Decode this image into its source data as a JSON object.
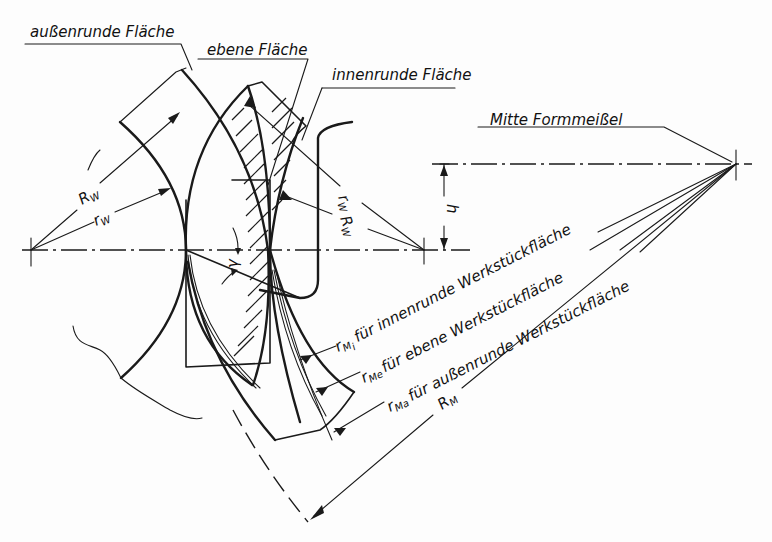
{
  "diagram": {
    "type": "technical-drawing",
    "labels": {
      "outer_round_surface": "außenrunde Fläche",
      "flat_surface": "ebene Fläche",
      "inner_round_surface": "innenrunde Fläche",
      "tool_center": "Mitte Formmeißel"
    },
    "dimensions": {
      "R_W_left": "R",
      "R_W_left_sub": "W",
      "r_W_left": "r",
      "r_W_left_sub": "W",
      "r_W_right": "r",
      "r_W_right_sub": "W",
      "R_W_right": "R",
      "R_W_right_sub": "W",
      "h": "h",
      "gamma": "γ",
      "gamma_sub": "o",
      "R_M": "R",
      "R_M_sub": "M"
    },
    "radius_callouts": [
      {
        "symbol": "r",
        "sub": "M",
        "subsub": "i",
        "text": "für innenrunde Werkstückfläche"
      },
      {
        "symbol": "r",
        "sub": "M",
        "subsub": "e",
        "text": "für ebene Werkstückfläche"
      },
      {
        "symbol": "r",
        "sub": "M",
        "subsub": "a",
        "text": "für außenrunde Werkstückfläche"
      }
    ],
    "colors": {
      "ink": "#1a1a1a",
      "paper": "#fdfdfd"
    }
  }
}
